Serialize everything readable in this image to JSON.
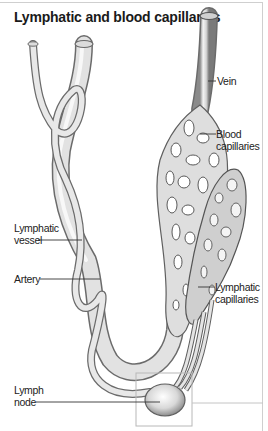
{
  "title": "Lymphatic and blood capillaries",
  "labels": {
    "vein": "Vein",
    "blood_capillaries_1": "Blood",
    "blood_capillaries_2": "capillaries",
    "lymphatic_vessel_1": "Lymphatic",
    "lymphatic_vessel_2": "vessel",
    "artery": "Artery",
    "lymphatic_capillaries_1": "Lymphatic",
    "lymphatic_capillaries_2": "capillaries",
    "lymph_node_1": "Lymph",
    "lymph_node_2": "node"
  },
  "colors": {
    "vessel_fill": "#e6e6e6",
    "vessel_stroke": "#6b6b6b",
    "leader_line": "#333333",
    "frame": "#cfcfcf"
  }
}
